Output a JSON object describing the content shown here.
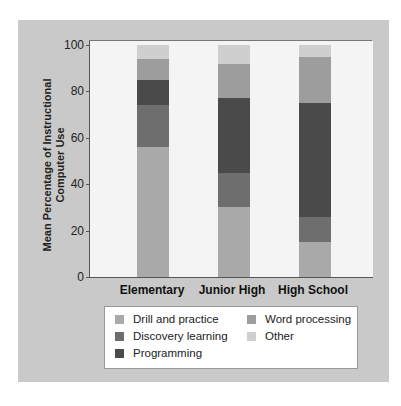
{
  "chart_data": {
    "type": "bar",
    "stacked": true,
    "title": "",
    "xlabel": "",
    "ylabel": "Mean Percentage of Instructional Computer Use",
    "ylim": [
      0,
      100
    ],
    "yticks": [
      0,
      20,
      40,
      60,
      80,
      100
    ],
    "categories": [
      "Elementary",
      "Junior High",
      "High School"
    ],
    "series": [
      {
        "name": "Drill and practice",
        "color": "#a9a9a9",
        "values": [
          56,
          30,
          15
        ]
      },
      {
        "name": "Discovery learning",
        "color": "#6e6e6e",
        "values": [
          18,
          15,
          11
        ]
      },
      {
        "name": "Programming",
        "color": "#4a4a4a",
        "values": [
          11,
          32,
          49
        ]
      },
      {
        "name": "Word processing",
        "color": "#9d9d9d",
        "values": [
          9,
          15,
          20
        ]
      },
      {
        "name": "Other",
        "color": "#cfcfcf",
        "values": [
          6,
          8,
          5
        ]
      }
    ],
    "legend_position": "bottom",
    "grid": false
  },
  "axis": {
    "ylabel_line1": "Mean Percentage of Instructional",
    "ylabel_line2": "Computer Use",
    "ticks": [
      "0",
      "20",
      "40",
      "60",
      "80",
      "100"
    ]
  },
  "categories": [
    "Elementary",
    "Junior High",
    "High School"
  ],
  "legend": [
    {
      "label": "Drill and practice",
      "color": "#a9a9a9"
    },
    {
      "label": "Discovery learning",
      "color": "#6e6e6e"
    },
    {
      "label": "Programming",
      "color": "#4a4a4a"
    },
    {
      "label": "Word processing",
      "color": "#9d9d9d"
    },
    {
      "label": "Other",
      "color": "#cfcfcf"
    }
  ]
}
